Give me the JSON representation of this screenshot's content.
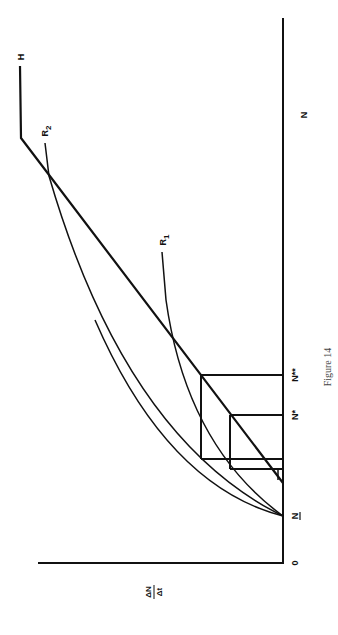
{
  "figure": {
    "caption": "Figure 14",
    "orientation": "rotated 90 degrees counter-clockwise",
    "axes": {
      "x_label": "N",
      "y_label_numerator": "ΔN",
      "y_label_denominator": "Δt",
      "origin_label": "0"
    },
    "x_ticks": [
      {
        "label": "N",
        "underline": true,
        "note": "N-bar / lower threshold"
      },
      {
        "label": "N*"
      },
      {
        "label": "N**"
      }
    ],
    "curves": [
      {
        "name": "H",
        "label": "H",
        "type": "kinked line"
      },
      {
        "name": "R1",
        "label": "R",
        "subscript": "1",
        "type": "concave curve"
      },
      {
        "name": "R2",
        "label": "R",
        "subscript": "2",
        "type": "convex curve"
      }
    ],
    "colors": {
      "ink": "#111111",
      "background": "#ffffff",
      "caption": "#444444"
    }
  }
}
